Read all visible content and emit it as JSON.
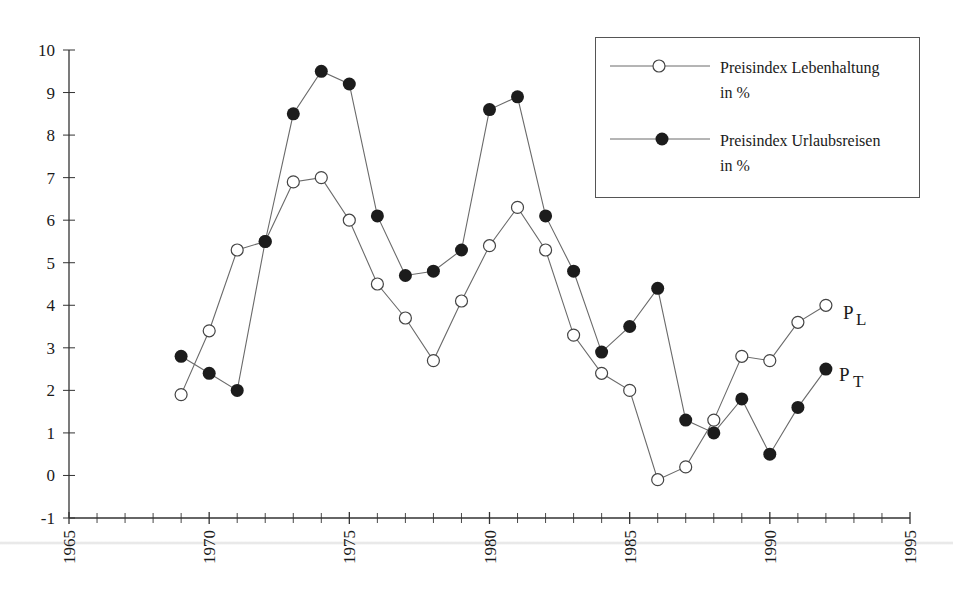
{
  "chart_data": {
    "type": "line",
    "title": "",
    "xlabel": "",
    "ylabel": "",
    "xlim": [
      1965,
      1995
    ],
    "ylim": [
      -1,
      10
    ],
    "grid": false,
    "legend_position": "top-right (boxed)",
    "x_ticks": [
      1965,
      1970,
      1975,
      1980,
      1985,
      1990,
      1995
    ],
    "x_tick_labels": [
      "1965",
      "1970",
      "1975",
      "1980",
      "1985",
      "1990",
      "1995"
    ],
    "y_ticks": [
      10,
      9,
      8,
      7,
      6,
      5,
      4,
      3,
      2,
      1,
      0,
      -1
    ],
    "y_tick_labels": [
      "10",
      "9",
      "8",
      "7",
      "6",
      "5",
      "4",
      "3",
      "2",
      "1",
      "0",
      "-1"
    ],
    "x": [
      1969,
      1970,
      1971,
      1972,
      1973,
      1974,
      1975,
      1976,
      1977,
      1978,
      1979,
      1980,
      1981,
      1982,
      1983,
      1984,
      1985,
      1986,
      1987,
      1988,
      1989,
      1990,
      1991,
      1992
    ],
    "series": [
      {
        "name": "Preisindex Lebenhaltung in %",
        "label": "P",
        "label_sub": "L",
        "marker": "open-circle",
        "values": [
          1.9,
          3.4,
          5.3,
          5.5,
          6.9,
          7.0,
          6.0,
          4.5,
          3.7,
          2.7,
          4.1,
          5.4,
          6.3,
          5.3,
          3.3,
          2.4,
          2.0,
          -0.1,
          0.2,
          1.3,
          2.8,
          2.7,
          3.6,
          4.0
        ]
      },
      {
        "name": "Preisindex Urlaubsreisen in %",
        "label": "P",
        "label_sub": "T",
        "marker": "filled-circle",
        "values": [
          2.8,
          2.4,
          2.0,
          5.5,
          8.5,
          9.5,
          9.2,
          6.1,
          4.7,
          4.8,
          5.3,
          8.6,
          8.9,
          6.1,
          4.8,
          2.9,
          3.5,
          4.4,
          1.3,
          1.0,
          1.8,
          0.5,
          1.6,
          2.5
        ]
      }
    ]
  },
  "legend": {
    "items": [
      {
        "line1": "Preisindex Lebenhaltung",
        "line2": "in %"
      },
      {
        "line1": "Preisindex Urlaubsreisen",
        "line2": "in %"
      }
    ]
  },
  "end_labels": {
    "pl_main": "P",
    "pl_sub": "L",
    "pt_main": "P",
    "pt_sub": "T"
  },
  "colors": {
    "line": "#6a6a6a",
    "marker_fill": "#1c1c1c",
    "marker_open_fill": "#ffffff",
    "axis": "#333333"
  }
}
